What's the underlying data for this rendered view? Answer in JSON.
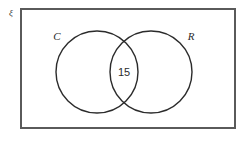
{
  "diagram": {
    "type": "venn",
    "title": "",
    "universal_set": {
      "label": "ξ",
      "border_color": "#5a5a5a"
    },
    "sets": [
      {
        "id": "C",
        "label": "C",
        "stroke_color": "#2b2b2b"
      },
      {
        "id": "R",
        "label": "R",
        "stroke_color": "#2b2b2b"
      }
    ],
    "regions": [
      {
        "id": "C-only",
        "label": "",
        "value": ""
      },
      {
        "id": "C-and-R",
        "label": "15",
        "value": "15"
      },
      {
        "id": "R-only",
        "label": "",
        "value": ""
      },
      {
        "id": "outside",
        "label": "",
        "value": ""
      }
    ],
    "intersection_count": "15"
  }
}
